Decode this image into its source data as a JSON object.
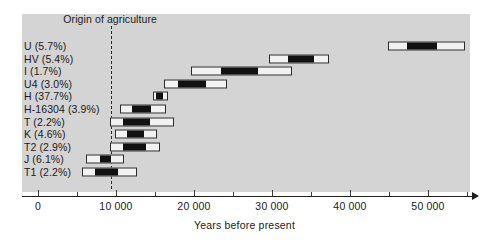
{
  "chart_data": {
    "type": "bar",
    "subtype": "range-bar-with-interval",
    "title": "",
    "annotation": "Origin of agriculture",
    "annotation_x": 9400,
    "xlabel": "Years before present",
    "ylabel": "",
    "xlim": [
      0,
      55600
    ],
    "grid": false,
    "legend": null,
    "ticks_major": [
      0,
      10000,
      20000,
      30000,
      40000,
      50000
    ],
    "tick_labels": [
      "0",
      "10 000",
      "20 000",
      "30 000",
      "40 000",
      "50 000"
    ],
    "ticks_minor": [
      5000,
      15000,
      25000,
      35000,
      45000,
      55000
    ],
    "categories": [
      "U (5.7%)",
      "HV (5.4%)",
      "I (1.7%)",
      "U4 (3.0%)",
      "H (37.7%)",
      "H-16304 (3.9%)",
      "T (2.2%)",
      "K (4.6%)",
      "T2 (2.9%)",
      "J (6.1%)",
      "T1 (2.2%)"
    ],
    "series": [
      {
        "name": "outer range (95% CI)",
        "intervals": [
          [
            44900,
            54700
          ],
          [
            29600,
            37300
          ],
          [
            19600,
            32600
          ],
          [
            16100,
            24200
          ],
          [
            14700,
            16700
          ],
          [
            10500,
            16400
          ],
          [
            9200,
            17400
          ],
          [
            9900,
            15200
          ],
          [
            9200,
            15600
          ],
          [
            6100,
            11000
          ],
          [
            5600,
            12700
          ]
        ]
      },
      {
        "name": "inner range (core estimate)",
        "intervals": [
          [
            47300,
            51100
          ],
          [
            32000,
            35400
          ],
          [
            23400,
            28200
          ],
          [
            18000,
            21600
          ],
          [
            15100,
            16000
          ],
          [
            12000,
            14500
          ],
          [
            10900,
            14400
          ],
          [
            11400,
            13600
          ],
          [
            10900,
            13800
          ],
          [
            7900,
            9300
          ],
          [
            7300,
            10200
          ]
        ]
      }
    ],
    "colors": {
      "plot_background": "#d4d4d4",
      "page_background": "#ffffff",
      "bar_outer_fill": "#f2f2f2",
      "bar_inner_fill": "#111111",
      "bar_stroke": "#2b2b2b",
      "axis": "#231f20",
      "text": "#1a1a1a",
      "origin_line": "#2b2b2b"
    }
  }
}
